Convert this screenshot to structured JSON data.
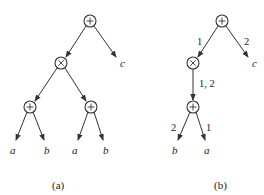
{
  "panels": [
    {
      "id": "a",
      "caption": "(a)",
      "nodes": [
        {
          "id": "root",
          "op": "+",
          "x": 90,
          "y": 21
        },
        {
          "id": "times",
          "op": "×",
          "x": 61,
          "y": 63
        },
        {
          "id": "plus_l",
          "op": "+",
          "x": 30,
          "y": 107
        },
        {
          "id": "plus_r",
          "op": "+",
          "x": 91,
          "y": 107
        }
      ],
      "leaves": [
        {
          "id": "c",
          "label": "c",
          "x": 122,
          "y": 64
        },
        {
          "id": "a1",
          "label": "a",
          "x": 13,
          "y": 151
        },
        {
          "id": "b1",
          "label": "b",
          "x": 47,
          "y": 151
        },
        {
          "id": "a2",
          "label": "a",
          "x": 75,
          "y": 151
        },
        {
          "id": "b2",
          "label": "b",
          "x": 106,
          "y": 151
        }
      ],
      "edges": [
        {
          "from": "root",
          "to": "times",
          "label": ""
        },
        {
          "from": "root",
          "to": "c",
          "label": ""
        },
        {
          "from": "times",
          "to": "plus_l",
          "label": ""
        },
        {
          "from": "times",
          "to": "plus_r",
          "label": ""
        },
        {
          "from": "plus_l",
          "to": "a1",
          "label": ""
        },
        {
          "from": "plus_l",
          "to": "b1",
          "label": ""
        },
        {
          "from": "plus_r",
          "to": "a2",
          "label": ""
        },
        {
          "from": "plus_r",
          "to": "b2",
          "label": ""
        }
      ]
    },
    {
      "id": "b",
      "caption": "(b)",
      "nodes": [
        {
          "id": "root",
          "op": "+",
          "x": 222,
          "y": 21
        },
        {
          "id": "times",
          "op": "×",
          "x": 193,
          "y": 63
        },
        {
          "id": "plus",
          "op": "+",
          "x": 193,
          "y": 107
        }
      ],
      "leaves": [
        {
          "id": "c",
          "label": "c",
          "x": 254,
          "y": 64
        },
        {
          "id": "b",
          "label": "b",
          "x": 175,
          "y": 151
        },
        {
          "id": "a",
          "label": "a",
          "x": 207,
          "y": 151
        }
      ],
      "edges": [
        {
          "from": "root",
          "to": "times",
          "label": "1"
        },
        {
          "from": "root",
          "to": "c",
          "label": "2"
        },
        {
          "from": "times",
          "to": "plus",
          "label": "1, 2"
        },
        {
          "from": "plus",
          "to": "b",
          "label": "2"
        },
        {
          "from": "plus",
          "to": "a",
          "label": "1"
        }
      ]
    }
  ]
}
